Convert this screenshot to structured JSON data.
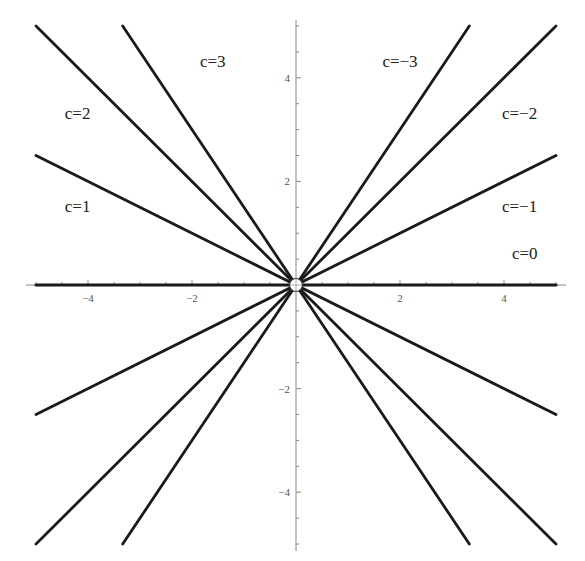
{
  "chart_data": {
    "type": "line",
    "title": "",
    "xlabel": "",
    "ylabel": "",
    "xlim": [
      -5,
      5
    ],
    "ylim": [
      -5,
      5
    ],
    "grid": false,
    "x_ticks": [
      -4,
      -2,
      2,
      4
    ],
    "y_ticks": [
      -4,
      -2,
      2,
      4
    ],
    "x_tick_labels": [
      "−4",
      "−2",
      "2",
      "4"
    ],
    "y_tick_labels": [
      "−4",
      "−2",
      "2",
      "4"
    ],
    "series": [
      {
        "name": "c=3",
        "c": 3,
        "slope": -1.5,
        "label": "c=3",
        "points": [
          [
            -3.333,
            5
          ],
          [
            3.333,
            -5
          ]
        ]
      },
      {
        "name": "c=2",
        "c": 2,
        "slope": -1.0,
        "label": "c=2",
        "points": [
          [
            -5,
            5
          ],
          [
            5,
            -5
          ]
        ]
      },
      {
        "name": "c=1",
        "c": 1,
        "slope": -0.5,
        "label": "c=1",
        "points": [
          [
            -5,
            2.5
          ],
          [
            5,
            -2.5
          ]
        ]
      },
      {
        "name": "c=0",
        "c": 0,
        "slope": 0.0,
        "label": "c=0",
        "points": [
          [
            -5,
            0
          ],
          [
            5,
            0
          ]
        ]
      },
      {
        "name": "c=-1",
        "c": -1,
        "slope": 0.5,
        "label": "c=−1",
        "points": [
          [
            -5,
            -2.5
          ],
          [
            5,
            2.5
          ]
        ]
      },
      {
        "name": "c=-2",
        "c": -2,
        "slope": 1.0,
        "label": "c=−2",
        "points": [
          [
            -5,
            -5
          ],
          [
            5,
            5
          ]
        ]
      },
      {
        "name": "c=-3",
        "c": -3,
        "slope": 1.5,
        "label": "c=−3",
        "points": [
          [
            -3.333,
            -5
          ],
          [
            3.333,
            5
          ]
        ]
      }
    ],
    "annotations": [
      {
        "text": "c=3",
        "x": -1.6,
        "y": 4.2
      },
      {
        "text": "c=2",
        "x": -4.2,
        "y": 3.2
      },
      {
        "text": "c=1",
        "x": -4.2,
        "y": 1.4
      },
      {
        "text": "c=−3",
        "x": 2.0,
        "y": 4.2
      },
      {
        "text": "c=−2",
        "x": 4.3,
        "y": 3.2
      },
      {
        "text": "c=−1",
        "x": 4.3,
        "y": 1.4
      },
      {
        "text": "c=0",
        "x": 4.4,
        "y": 0.5
      }
    ],
    "open_point": [
      0,
      0
    ]
  }
}
